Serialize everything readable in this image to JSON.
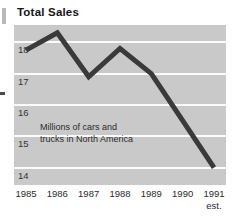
{
  "chart_data": {
    "type": "line",
    "title": "Total Sales",
    "annotation": "Millions of cars and trucks in North America",
    "annotation_lines": [
      "Millions of cars and",
      "trucks in North America"
    ],
    "categories": [
      "1985",
      "1986",
      "1987",
      "1988",
      "1989",
      "1990",
      "1991"
    ],
    "x_sub_labels": [
      "",
      "",
      "",
      "",
      "",
      "",
      "est."
    ],
    "values": [
      17.75,
      18.3,
      16.9,
      17.8,
      17.0,
      15.5,
      14.0
    ],
    "xlabel": "",
    "ylabel": "",
    "ylim": [
      13.45,
      18.55
    ],
    "yticks": [
      "18",
      "17",
      "16",
      "15",
      "14"
    ],
    "ytick_values": [
      18,
      17,
      16,
      15,
      14
    ],
    "grid": true,
    "legend": "none",
    "series_color": "#3a3a3a",
    "plot_background": "#c9c9c9",
    "gridline_color": "#fbfbfb",
    "title_color": "#161616"
  },
  "marks": {
    "margin_mark_top": "page-margin-bar",
    "margin_mark_mid": "page-margin-dash"
  }
}
